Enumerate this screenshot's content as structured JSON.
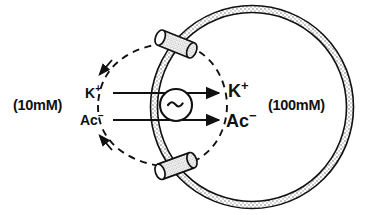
{
  "figure": {
    "background_color": "#ffffff",
    "ink_color": "#111111",
    "width": 365,
    "height": 215
  },
  "labels": {
    "concentration_outside": "(10mM)",
    "concentration_inside": "(100mM)",
    "ion_potassium_outside": "K",
    "ion_potassium_outside_charge": "+",
    "ion_acetate_outside": "Ac",
    "ion_acetate_outside_charge": "−",
    "ion_potassium_inside": "K",
    "ion_potassium_inside_charge": "+",
    "ion_acetate_inside": "Ac",
    "ion_acetate_inside_charge": "−",
    "transporter_symbol": "∼"
  },
  "elements": {
    "vesicle_membrane": "stippled-double-line-circle",
    "transporter": "circle-with-tilde",
    "channel_top": "cylindrical-pore-plug",
    "channel_bottom": "cylindrical-pore-plug",
    "arrow_potassium": "solid-arrow-rightward",
    "arrow_acetate": "solid-arrow-rightward",
    "recycle_loop": "dashed-ellipse-with-arrowheads"
  },
  "geometry": {
    "vesicle_center_x": 252,
    "vesicle_center_y": 107,
    "vesicle_radius": 98,
    "membrane_thickness": 7,
    "transporter_center_x": 176,
    "transporter_center_y": 105,
    "transporter_radius": 16,
    "channel_top_x": 176,
    "channel_top_y": 44,
    "channel_bottom_x": 176,
    "channel_bottom_y": 166,
    "arrow_potassium_y": 93,
    "arrow_acetate_y": 120,
    "arrow_start_x": 113,
    "arrow_end_x": 222,
    "dashed_ellipse_center_x": 176,
    "dashed_ellipse_center_y": 105,
    "dashed_ellipse_rx": 78,
    "dashed_ellipse_ry": 62
  },
  "colors": {
    "ink": "#111111",
    "membrane_fill": "#ffffff",
    "stipple": "#777777",
    "paper": "#ffffff"
  }
}
